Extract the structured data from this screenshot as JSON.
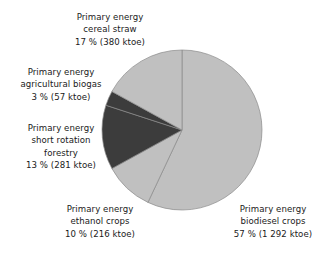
{
  "chart_data": {
    "type": "pie",
    "title": "",
    "subtitle": "",
    "xlabel": "",
    "ylabel": "",
    "legend_position": "none",
    "grid": false,
    "unit": "ktoe",
    "total_value": 2226,
    "start_angle_deg": 0,
    "direction": "clockwise",
    "categories": [
      "Primary energy biodiesel crops",
      "Primary energy ethanol crops",
      "Primary energy short rotation forestry",
      "Primary energy agricultural biogas",
      "Primary energy cereal straw"
    ],
    "values": [
      1292,
      216,
      281,
      57,
      380
    ],
    "percentages": [
      57,
      10,
      13,
      3,
      17
    ],
    "colors": [
      "#c0c0c0",
      "#c0c0c0",
      "#3c3c3c",
      "#3c3c3c",
      "#c0c0c0"
    ],
    "slices": [
      {
        "name": "biodiesel-crops",
        "label_line1": "Primary energy",
        "label_line2": "biodiesel crops",
        "label_line3": "57 % (1 292 ktoe)",
        "percent": 57,
        "value": 1292,
        "unit": "ktoe",
        "color": "#c0c0c0"
      },
      {
        "name": "ethanol-crops",
        "label_line1": "Primary energy",
        "label_line2": "ethanol crops",
        "label_line3": "10 % (216 ktoe)",
        "percent": 10,
        "value": 216,
        "unit": "ktoe",
        "color": "#c0c0c0"
      },
      {
        "name": "short-rotation-forestry",
        "label_line1": "Primary energy",
        "label_line2": "short rotation",
        "label_line3": "forestry",
        "label_line4": "13 % (281 ktoe)",
        "percent": 13,
        "value": 281,
        "unit": "ktoe",
        "color": "#3c3c3c"
      },
      {
        "name": "agricultural-biogas",
        "label_line1": "Primary energy",
        "label_line2": "agricultural biogas",
        "label_line3": "3 % (57 ktoe)",
        "percent": 3,
        "value": 57,
        "unit": "ktoe",
        "color": "#3c3c3c"
      },
      {
        "name": "cereal-straw",
        "label_line1": "Primary energy",
        "label_line2": "cereal straw",
        "label_line3": "17 % (380 ktoe)",
        "percent": 17,
        "value": 380,
        "unit": "ktoe",
        "color": "#c0c0c0"
      }
    ]
  },
  "style": {
    "background": "#ffffff",
    "text_color": "#1a1a1a",
    "slice_light": "#c0c0c0",
    "slice_dark": "#3c3c3c",
    "slice_border": "#8a8a8a"
  },
  "geometry": {
    "center_x": 182,
    "center_y": 130,
    "radius": 80
  }
}
